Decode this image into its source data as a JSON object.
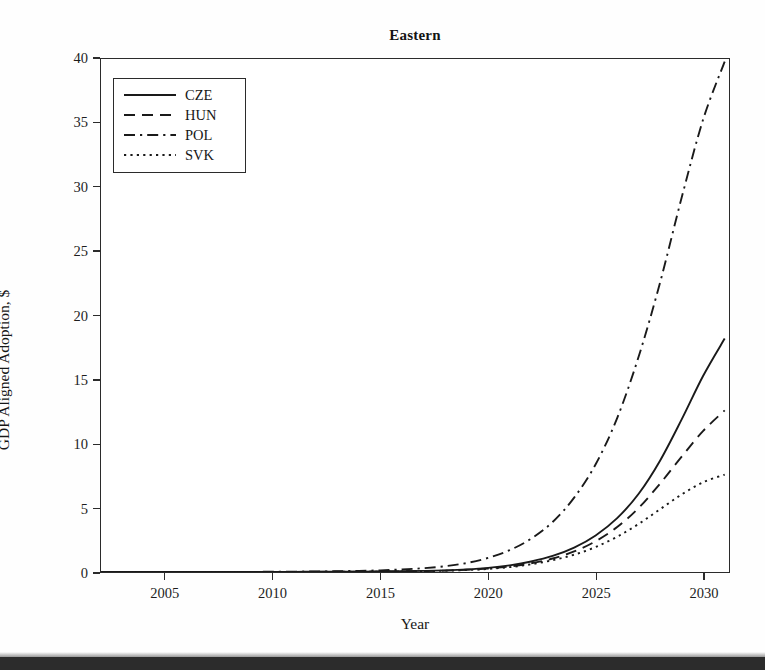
{
  "figure": {
    "title": "Eastern",
    "background_color": "#ffffff",
    "frame_color": "#2b2b2b",
    "page_edge_color": "#2c2c2c"
  },
  "axes": {
    "x_label": "Year",
    "y_label": "GDP Aligned Adoption, $",
    "x_ticks": [
      "2005",
      "2010",
      "2015",
      "2020",
      "2025",
      "2030"
    ],
    "y_ticks": [
      "0",
      "5",
      "10",
      "15",
      "20",
      "25",
      "30",
      "35",
      "40"
    ]
  },
  "legend": {
    "position": "upper-left",
    "entries": [
      {
        "label": "CZE",
        "dash": "solid"
      },
      {
        "label": "HUN",
        "dash": "dashed"
      },
      {
        "label": "POL",
        "dash": "dashdot"
      },
      {
        "label": "SVK",
        "dash": "dotted"
      }
    ]
  },
  "chart_data": {
    "type": "line",
    "title": "Eastern",
    "xlabel": "Year",
    "ylabel": "GDP Aligned Adoption, $",
    "xlim": [
      2002.0,
      2031.2
    ],
    "ylim": [
      0,
      40
    ],
    "xticks": [
      2005,
      2010,
      2015,
      2020,
      2025,
      2030
    ],
    "yticks": [
      0,
      5,
      10,
      15,
      20,
      25,
      30,
      35,
      40
    ],
    "grid": false,
    "legend_position": "upper left",
    "line_color": "#1a1a1a",
    "x": [
      2002,
      2003,
      2004,
      2005,
      2006,
      2007,
      2008,
      2009,
      2010,
      2011,
      2012,
      2013,
      2014,
      2015,
      2016,
      2017,
      2018,
      2019,
      2020,
      2021,
      2022,
      2023,
      2024,
      2025,
      2026,
      2027,
      2028,
      2029,
      2030,
      2031
    ],
    "series": [
      {
        "name": "CZE",
        "dash": "solid",
        "final_value": 18.2,
        "values": [
          0.0,
          0.0,
          0.0,
          0.0,
          0.0,
          0.0,
          0.0,
          0.01,
          0.01,
          0.01,
          0.02,
          0.02,
          0.03,
          0.04,
          0.06,
          0.09,
          0.13,
          0.2,
          0.32,
          0.52,
          0.82,
          1.25,
          1.9,
          2.85,
          4.2,
          6.1,
          8.7,
          11.9,
          15.3,
          18.2
        ]
      },
      {
        "name": "HUN",
        "dash": "dashed",
        "final_value": 12.6,
        "values": [
          0.0,
          0.0,
          0.0,
          0.0,
          0.0,
          0.0,
          0.0,
          0.0,
          0.01,
          0.01,
          0.01,
          0.02,
          0.02,
          0.03,
          0.05,
          0.07,
          0.11,
          0.17,
          0.27,
          0.43,
          0.68,
          1.05,
          1.6,
          2.4,
          3.5,
          5.0,
          6.9,
          9.0,
          11.0,
          12.6
        ]
      },
      {
        "name": "POL",
        "dash": "dashdot",
        "final_value": 39.8,
        "values": [
          0.0,
          0.0,
          0.0,
          0.0,
          0.0,
          0.01,
          0.01,
          0.01,
          0.02,
          0.03,
          0.04,
          0.06,
          0.09,
          0.13,
          0.2,
          0.3,
          0.45,
          0.7,
          1.1,
          1.7,
          2.6,
          3.9,
          5.8,
          8.4,
          12.0,
          16.8,
          22.6,
          29.2,
          35.3,
          39.8
        ]
      },
      {
        "name": "SVK",
        "dash": "dotted",
        "final_value": 7.6,
        "values": [
          0.0,
          0.0,
          0.0,
          0.0,
          0.0,
          0.0,
          0.0,
          0.0,
          0.0,
          0.01,
          0.01,
          0.01,
          0.02,
          0.03,
          0.04,
          0.06,
          0.1,
          0.15,
          0.24,
          0.38,
          0.6,
          0.92,
          1.35,
          1.95,
          2.75,
          3.75,
          4.9,
          6.05,
          7.0,
          7.6
        ]
      }
    ]
  }
}
